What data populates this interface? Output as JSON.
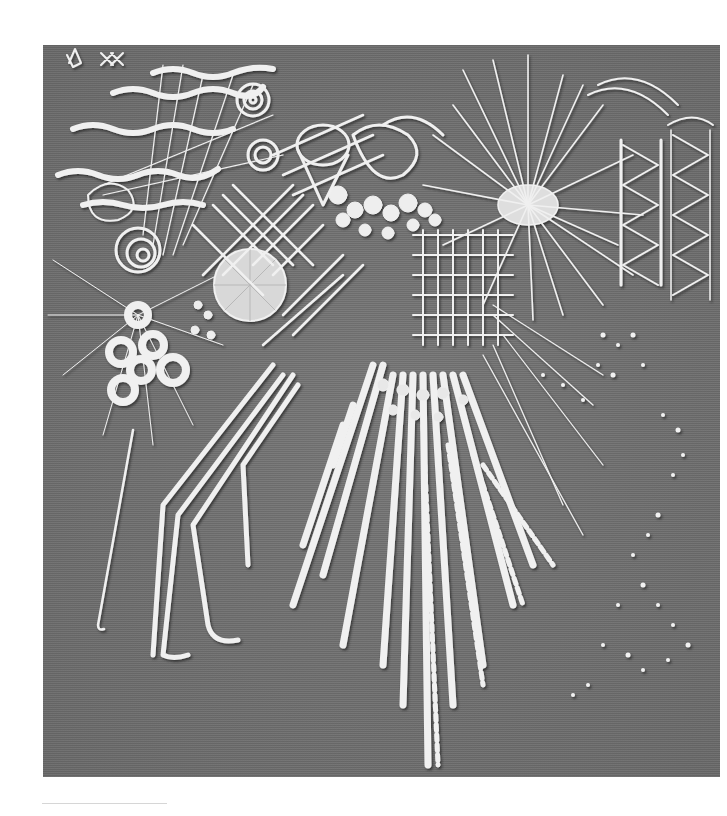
{
  "image": {
    "subject": "Black-and-white photograph of an abstract white-thread embroidery on grey woven fabric",
    "marks": [
      "ꝏ-like stitched glyph",
      "XX"
    ],
    "colors": {
      "fabric": "#6e6e6e",
      "thread": "#f2f2f2",
      "shadow": "#3c3c3c",
      "page": "#ffffff"
    },
    "elements": [
      "wavy horizontal couched threads (top-left)",
      "spiral rosettes",
      "lattice / trellis net stitches",
      "large woven circle (spider-web wheel)",
      "ring stitches cluster with radiating straight stitches",
      "bead-like French knot clusters",
      "starburst of long straight stitches (top-right)",
      "two vertical zig-zag bands (far right)",
      "grid of long stitches (center)",
      "cascading fan of heavy stitches (center-bottom)",
      "long trailing cords (left-bottom)",
      "scattered seed stitches (right)"
    ]
  }
}
